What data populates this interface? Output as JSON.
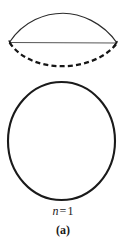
{
  "figure": {
    "panel_label": "(a)",
    "mode_label": {
      "symbol": "n",
      "relation": "=",
      "value": "1",
      "full": "n = 1"
    },
    "background_color": "#ffffff",
    "stroke_color": "#1a1a1a",
    "shapes": {
      "lens": {
        "name": "standing-wave-lens",
        "left_vertex_x": 9,
        "right_vertex_x": 117,
        "axis_y": 42,
        "upper_arc_apex_y": 13,
        "lower_arc_apex_y": 66,
        "upper_arc_style": "solid",
        "lower_arc_style": "dashed",
        "chord_style": "solid",
        "upper_arc_width": 1.1,
        "lower_arc_width": 2.2,
        "chord_width": 1.0,
        "dash_pattern": "5,3.2"
      },
      "circle": {
        "name": "resonator-circle",
        "center_x": 61.5,
        "center_y": 141,
        "radius_x": 53.5,
        "radius_y": 59,
        "stroke_width": 2.1,
        "fill": "none"
      }
    }
  }
}
